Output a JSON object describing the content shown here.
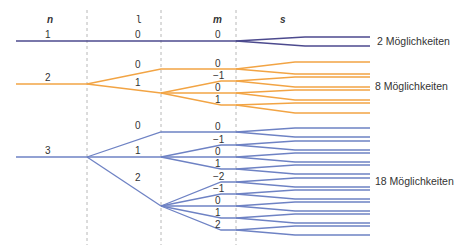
{
  "headers": {
    "n": "n",
    "l": "l",
    "m": "m",
    "s": "s"
  },
  "colors": {
    "n1": "#4c4a8e",
    "n2": "#f2a444",
    "n3": "#6e82c4",
    "guide": "#b8b8b8",
    "text": "#333333"
  },
  "groups": [
    {
      "n": "1",
      "total_label": "2 Möglichkeiten",
      "l_values": [
        {
          "l": "0",
          "m_values": [
            "0"
          ]
        }
      ]
    },
    {
      "n": "2",
      "total_label": "8 Möglichkeiten",
      "l_values": [
        {
          "l": "0",
          "m_values": [
            "0"
          ]
        },
        {
          "l": "1",
          "m_values": [
            "−1",
            "0",
            "1"
          ]
        }
      ]
    },
    {
      "n": "3",
      "total_label": "18 Möglichkeiten",
      "l_values": [
        {
          "l": "0",
          "m_values": [
            "0"
          ]
        },
        {
          "l": "1",
          "m_values": [
            "−1",
            "0",
            "1"
          ]
        },
        {
          "l": "2",
          "m_values": [
            "−2",
            "−1",
            "0",
            "1",
            "2"
          ]
        }
      ]
    }
  ],
  "labels": {
    "n1": {
      "n": "1",
      "l0": "0",
      "m0": "0",
      "total": "2 Möglichkeiten"
    },
    "n2": {
      "n": "2",
      "l0": "0",
      "l1": "1",
      "m_l0": [
        "0"
      ],
      "m_l1": [
        "−1",
        "0",
        "1"
      ],
      "total": "8 Möglichkeiten"
    },
    "n3": {
      "n": "3",
      "l0": "0",
      "l1": "1",
      "l2": "2",
      "m_l0": [
        "0"
      ],
      "m_l1": [
        "−1",
        "0",
        "1"
      ],
      "m_l2": [
        "−2",
        "−1",
        "0",
        "1",
        "2"
      ],
      "total": "18 Möglichkeiten"
    }
  }
}
